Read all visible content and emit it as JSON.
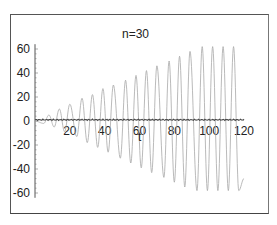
{
  "chart_data": {
    "type": "line",
    "title": "n=30",
    "xlabel": "t",
    "ylabel": "",
    "xlim": [
      0,
      120
    ],
    "ylim": [
      -65,
      65
    ],
    "grid": false,
    "legend": null,
    "x_ticks": [
      20,
      40,
      60,
      80,
      100,
      120
    ],
    "x_tick_labels": [
      "20",
      "40",
      "60",
      "80",
      "100",
      "120"
    ],
    "y_ticks": [
      60,
      40,
      20,
      0,
      -20,
      -40,
      -60
    ],
    "y_tick_labels": [
      "60",
      "40",
      "20",
      "0",
      "-20",
      "-40",
      "-60"
    ],
    "series": [
      {
        "name": "response",
        "color": "#9a9a9a",
        "style": "thin dotted-gray oscillation with linearly growing amplitude, capped near 62 after t≈95",
        "period": 6.2832,
        "peaks": [
          {
            "t": 8,
            "y": 5
          },
          {
            "t": 14,
            "y": 10
          },
          {
            "t": 20,
            "y": 14
          },
          {
            "t": 27,
            "y": 19
          },
          {
            "t": 33,
            "y": 22
          },
          {
            "t": 39,
            "y": 27
          },
          {
            "t": 45,
            "y": 30
          },
          {
            "t": 52,
            "y": 34
          },
          {
            "t": 58,
            "y": 38
          },
          {
            "t": 64,
            "y": 42
          },
          {
            "t": 70,
            "y": 46
          },
          {
            "t": 77,
            "y": 50
          },
          {
            "t": 83,
            "y": 54
          },
          {
            "t": 89,
            "y": 58
          },
          {
            "t": 96,
            "y": 62
          },
          {
            "t": 102,
            "y": 62
          },
          {
            "t": 108,
            "y": 62
          },
          {
            "t": 114,
            "y": 62
          }
        ],
        "troughs": [
          {
            "t": 5,
            "y": -2
          },
          {
            "t": 11,
            "y": -5
          },
          {
            "t": 17,
            "y": -9
          },
          {
            "t": 24,
            "y": -13
          },
          {
            "t": 30,
            "y": -18
          },
          {
            "t": 36,
            "y": -22
          },
          {
            "t": 42,
            "y": -26
          },
          {
            "t": 49,
            "y": -31
          },
          {
            "t": 55,
            "y": -35
          },
          {
            "t": 61,
            "y": -39
          },
          {
            "t": 67,
            "y": -43
          },
          {
            "t": 74,
            "y": -47
          },
          {
            "t": 80,
            "y": -51
          },
          {
            "t": 86,
            "y": -55
          },
          {
            "t": 93,
            "y": -58
          },
          {
            "t": 99,
            "y": -58
          },
          {
            "t": 105,
            "y": -58
          },
          {
            "t": 111,
            "y": -58
          },
          {
            "t": 117,
            "y": -58
          }
        ],
        "end": {
          "t": 120,
          "y": -48
        }
      },
      {
        "name": "forcing (Fourier partial sum, n=30)",
        "color": "#444444",
        "style": "dark wiggly line hugging y≈1",
        "mean": 1,
        "ripple_amplitude": 1.2,
        "t_range": [
          0,
          120
        ]
      }
    ]
  }
}
